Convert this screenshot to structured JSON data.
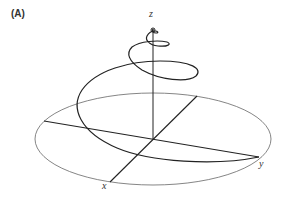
{
  "figure": {
    "panel_label": "(A)",
    "axes": {
      "x_label": "x",
      "y_label": "y",
      "z_label": "z"
    },
    "colors": {
      "line": "#222222",
      "ellipse": "#555555",
      "background": "#ffffff"
    }
  }
}
